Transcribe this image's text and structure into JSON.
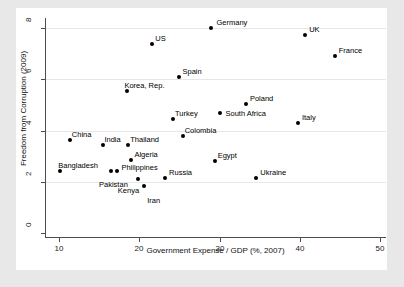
{
  "chart_data": {
    "type": "scatter",
    "title": "",
    "xlabel": "Government Expense / GDP (%, 2007)",
    "ylabel": "Freedom from Corruption (2009)",
    "xlim": [
      8.2,
      50.8
    ],
    "ylim": [
      -0.2,
      8.4
    ],
    "xticks": [
      10,
      20,
      30,
      40,
      50
    ],
    "yticks": [
      0,
      2,
      4,
      6,
      8
    ],
    "xticklabels": [
      "10",
      "20",
      "30",
      "40",
      "50"
    ],
    "yticklabels": [
      "0",
      "2",
      "4",
      "6",
      "8"
    ],
    "grid": "horizontal",
    "legend": "none",
    "points": [
      {
        "label": "Germany",
        "x": 29.0,
        "y": 8.0,
        "label_dx": 5,
        "label_dy": -10
      },
      {
        "label": "UK",
        "x": 40.7,
        "y": 7.75,
        "label_dx": 4,
        "label_dy": -10
      },
      {
        "label": "US",
        "x": 21.6,
        "y": 7.4,
        "label_dx": 3,
        "label_dy": -10
      },
      {
        "label": "France",
        "x": 44.4,
        "y": 6.9,
        "label_dx": 4,
        "label_dy": -10
      },
      {
        "label": "Spain",
        "x": 25.0,
        "y": 6.1,
        "label_dx": 3,
        "label_dy": -10
      },
      {
        "label": "Korea, Rep.",
        "x": 18.5,
        "y": 5.55,
        "label_dx": -3,
        "label_dy": -10
      },
      {
        "label": "Poland",
        "x": 33.3,
        "y": 5.05,
        "label_dx": 4,
        "label_dy": -10
      },
      {
        "label": "South Africa",
        "x": 30.0,
        "y": 4.7,
        "label_dx": 6,
        "label_dy": -4
      },
      {
        "label": "Turkey",
        "x": 24.2,
        "y": 4.45,
        "label_dx": 2,
        "label_dy": -10
      },
      {
        "label": "Italy",
        "x": 39.8,
        "y": 4.3,
        "label_dx": 4,
        "label_dy": -10
      },
      {
        "label": "Colombia",
        "x": 25.4,
        "y": 3.8,
        "label_dx": 2,
        "label_dy": -10
      },
      {
        "label": "China",
        "x": 11.3,
        "y": 3.65,
        "label_dx": 2,
        "label_dy": -10
      },
      {
        "label": "India",
        "x": 15.5,
        "y": 3.45,
        "label_dx": 1,
        "label_dy": -10
      },
      {
        "label": "Thailand",
        "x": 18.6,
        "y": 3.45,
        "label_dx": 2,
        "label_dy": -10
      },
      {
        "label": "Algeria",
        "x": 19.0,
        "y": 2.85,
        "label_dx": 3,
        "label_dy": -10
      },
      {
        "label": "Egypt",
        "x": 29.4,
        "y": 2.8,
        "label_dx": 3,
        "label_dy": -10
      },
      {
        "label": "Bangladesh",
        "x": 10.1,
        "y": 2.4,
        "label_dx": -2,
        "label_dy": -10
      },
      {
        "label": "Philippines",
        "x": 16.5,
        "y": 2.4,
        "label_dx": 10,
        "label_dy": -8
      },
      {
        "label": "Pakistan",
        "x": 17.2,
        "y": 2.4,
        "label_dx": -18,
        "label_dy": 9
      },
      {
        "label": "Ukraine",
        "x": 34.6,
        "y": 2.15,
        "label_dx": 4,
        "label_dy": -10
      },
      {
        "label": "Russia",
        "x": 23.2,
        "y": 2.15,
        "label_dx": 4,
        "label_dy": -10
      },
      {
        "label": "Kenya",
        "x": 19.8,
        "y": 2.1,
        "label_dx": -20,
        "label_dy": 7
      },
      {
        "label": "Iran",
        "x": 20.6,
        "y": 1.85,
        "label_dx": 3,
        "label_dy": 10
      }
    ]
  }
}
